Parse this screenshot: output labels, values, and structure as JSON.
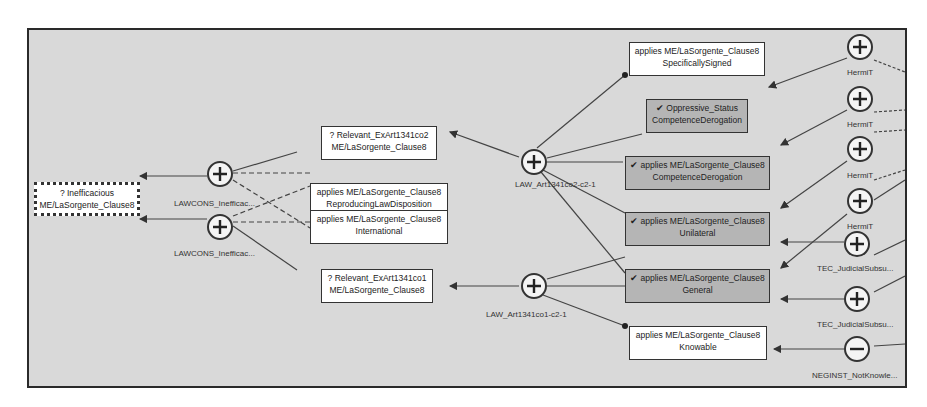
{
  "diagram": {
    "type": "argument-graph",
    "colors": {
      "background": "#d9d9d9",
      "node_fill": "#ffffff",
      "accepted_node_fill": "#b5b5b5",
      "border": "#333333"
    },
    "nodes": {
      "inefficacious": {
        "line1": "? Inefficacious",
        "line2": "ME/LaSorgente_Clause8",
        "status": "focus"
      },
      "relevant_co2": {
        "line1": "? Relevant_ExArt1341co2",
        "line2": "ME/LaSorgente_Clause8",
        "status": "open"
      },
      "reproducing": {
        "line1": "applies ME/LaSorgente_Clause8",
        "line2": "ReproducingLawDisposition",
        "status": "open"
      },
      "international": {
        "line1": "applies ME/LaSorgente_Clause8",
        "line2": "International",
        "status": "open"
      },
      "relevant_co1": {
        "line1": "? Relevant_ExArt1341co1",
        "line2": "ME/LaSorgente_Clause8",
        "status": "open"
      },
      "specifically_signed": {
        "line1": "applies ME/LaSorgente_Clause8",
        "line2": "SpecificallySigned",
        "status": "open"
      },
      "oppressive_status": {
        "line1": "✔ Oppressive_Status",
        "line2": "CompetenceDerogation",
        "status": "accepted"
      },
      "competence_derogation": {
        "line1": "✔ applies ME/LaSorgente_Clause8",
        "line2": "CompetenceDerogation",
        "status": "accepted"
      },
      "unilateral": {
        "line1": "✔ applies ME/LaSorgente_Clause8",
        "line2": "Unilateral",
        "status": "accepted"
      },
      "general": {
        "line1": "✔ applies ME/LaSorgente_Clause8",
        "line2": "General",
        "status": "accepted"
      },
      "knowable": {
        "line1": "applies ME/LaSorgente_Clause8",
        "line2": "Knowable",
        "status": "open"
      }
    },
    "arguments": {
      "lawcons1": {
        "sign": "+",
        "label": "LAWCONS_Inefficac..."
      },
      "lawcons2": {
        "sign": "+",
        "label": "LAWCONS_Inefficac..."
      },
      "law_co2": {
        "sign": "+",
        "label": "LAW_Art1341co2-c2-1"
      },
      "law_co1": {
        "sign": "+",
        "label": "LAW_Art1341co1-c2-1"
      },
      "hermit1": {
        "sign": "+",
        "label": "HermiT"
      },
      "hermit2": {
        "sign": "+",
        "label": "HermiT"
      },
      "hermit3": {
        "sign": "+",
        "label": "HermiT"
      },
      "hermit4": {
        "sign": "+",
        "label": "HermiT"
      },
      "tec1": {
        "sign": "+",
        "label": "TEC_JudicialSubsu..."
      },
      "tec2": {
        "sign": "+",
        "label": "TEC_JudicialSubsu..."
      },
      "neginst": {
        "sign": "−",
        "label": "NEGINST_NotKnowle..."
      }
    }
  }
}
